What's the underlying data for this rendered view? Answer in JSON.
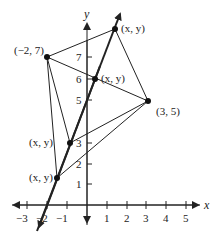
{
  "diagram": {
    "axis_labels": {
      "x": "x",
      "y": "y"
    },
    "x_ticks": [
      "−3",
      "−2",
      "−1",
      "1",
      "2",
      "3",
      "4",
      "5"
    ],
    "y_ticks": [
      "1",
      "2",
      "3",
      "5",
      "6",
      "7"
    ],
    "points": [
      {
        "id": "p-neg2-7",
        "label": "(−2, 7)"
      },
      {
        "id": "p-top",
        "label": "(x, y)"
      },
      {
        "id": "p-mid",
        "label": "(x, y)"
      },
      {
        "id": "p-3-5",
        "label": "(3, 5)"
      },
      {
        "id": "p-low",
        "label": "(x, y)"
      },
      {
        "id": "p-bottom",
        "label": "(x, y)"
      }
    ],
    "colors": {
      "line": "#222222",
      "point": "#111111"
    }
  }
}
